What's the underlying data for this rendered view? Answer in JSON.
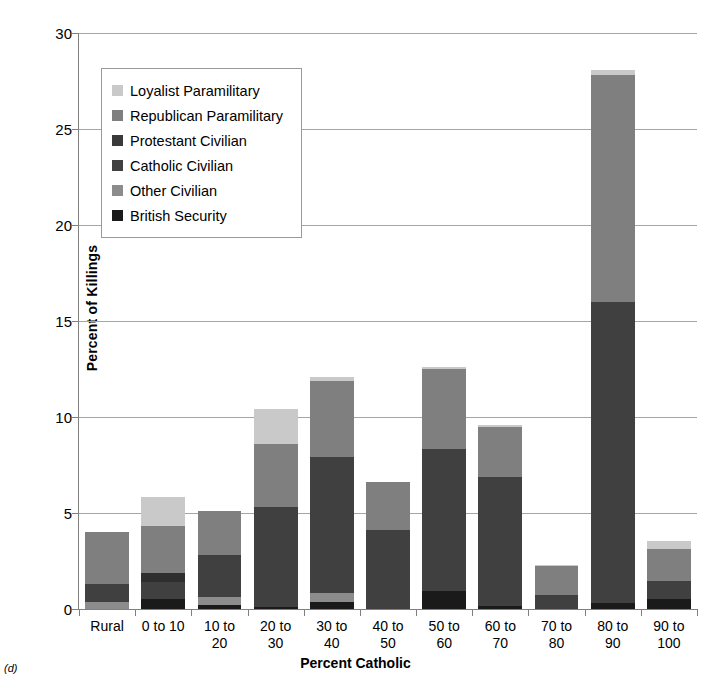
{
  "panel_label": "(d)",
  "chart_data": {
    "type": "bar",
    "stacked": true,
    "title": "",
    "xlabel": "Percent Catholic",
    "ylabel": "Percent of Killings",
    "ylim": [
      0,
      30
    ],
    "yticks": [
      0,
      5,
      10,
      15,
      20,
      25,
      30
    ],
    "grid": true,
    "legend_position": "upper-left",
    "categories": [
      "Rural",
      "0 to 10",
      "10 to 20",
      "20 to 30",
      "30 to 40",
      "40 to 50",
      "50 to 60",
      "60 to 70",
      "70 to 80",
      "80 to 90",
      "90 to 100"
    ],
    "category_lines": [
      [
        "Rural"
      ],
      [
        "0 to 10"
      ],
      [
        "10 to",
        "20"
      ],
      [
        "20 to",
        "30"
      ],
      [
        "30 to",
        "40"
      ],
      [
        "40 to",
        "50"
      ],
      [
        "50 to",
        "60"
      ],
      [
        "60 to",
        "70"
      ],
      [
        "70 to",
        "80"
      ],
      [
        "80 to",
        "90"
      ],
      [
        "90 to",
        "100"
      ]
    ],
    "series": [
      {
        "name": "British Security",
        "color": "#1a1a1a",
        "values": [
          0.0,
          0.5,
          0.2,
          0.1,
          0.35,
          0.0,
          0.95,
          0.15,
          0.0,
          0.3,
          0.5
        ]
      },
      {
        "name": "Other Civilian",
        "color": "#8c8c8c",
        "values": [
          0.35,
          0.0,
          0.45,
          0.0,
          0.5,
          0.0,
          0.0,
          0.0,
          0.0,
          0.0,
          0.0
        ]
      },
      {
        "name": "Catholic Civilian",
        "color": "#404040",
        "values": [
          0.95,
          0.9,
          2.15,
          5.2,
          7.05,
          4.1,
          7.4,
          6.75,
          0.75,
          15.7,
          0.95
        ]
      },
      {
        "name": "Protestant Civilian",
        "color": "#2e2e2e",
        "values": [
          0.0,
          0.5,
          0.0,
          0.0,
          0.0,
          0.0,
          0.0,
          0.0,
          0.0,
          0.0,
          0.0
        ]
      },
      {
        "name": "Republican Paramilitary",
        "color": "#7f7f7f",
        "values": [
          2.7,
          2.4,
          2.3,
          3.3,
          4.0,
          2.5,
          4.15,
          2.6,
          1.5,
          11.8,
          1.7
        ]
      },
      {
        "name": "Loyalist Paramilitary",
        "color": "#c9c9c9",
        "values": [
          0.0,
          1.55,
          0.0,
          1.8,
          0.2,
          0.0,
          0.1,
          0.1,
          0.05,
          0.3,
          0.4
        ]
      }
    ],
    "totals": [
      4.0,
      5.85,
      5.1,
      10.4,
      12.1,
      6.6,
      12.6,
      9.6,
      2.3,
      28.1,
      3.55
    ],
    "legend_order": [
      "Loyalist Paramilitary",
      "Republican Paramilitary",
      "Protestant Civilian",
      "Catholic Civilian",
      "Other Civilian",
      "British Security"
    ],
    "legend_colors": {
      "Loyalist Paramilitary": "#c9c9c9",
      "Republican Paramilitary": "#7f7f7f",
      "Protestant Civilian": "#3a3a3a",
      "Catholic Civilian": "#404040",
      "Other Civilian": "#8c8c8c",
      "British Security": "#1a1a1a"
    }
  }
}
